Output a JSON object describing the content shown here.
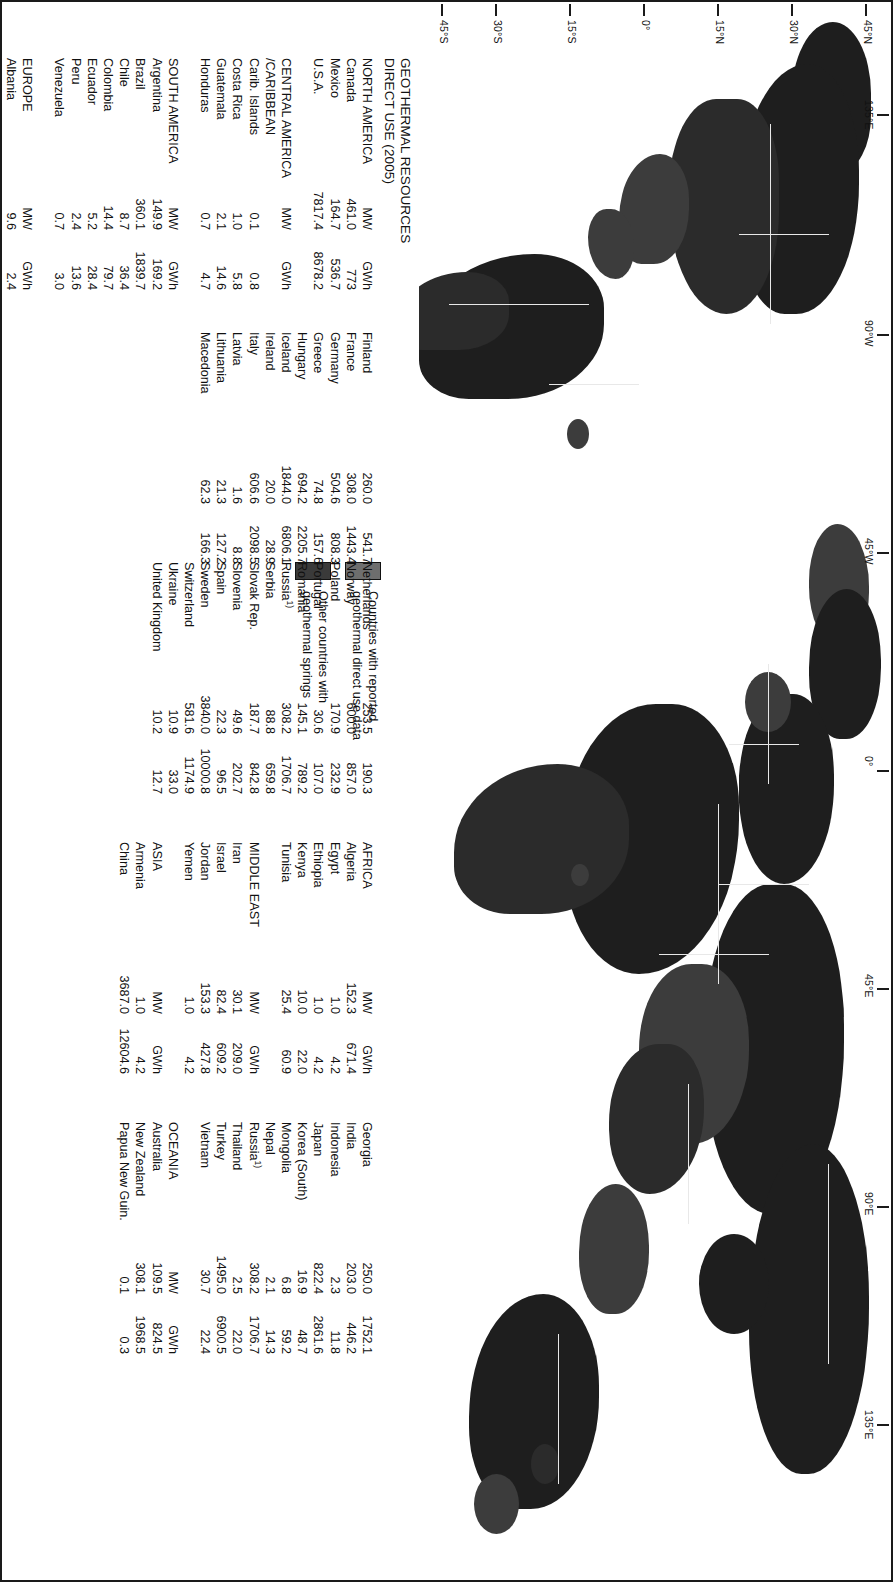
{
  "figure": {
    "title_line1": "GEOTHERMAL RESOURCES",
    "title_line2": "DIRECT USE (2005)",
    "title": "GEOTHERMAL RESOURCES\nDIRECT USE (2005)"
  },
  "legend": {
    "items": [
      {
        "swatch_color": "#6e6e6e",
        "label": "Countries with reported\ngeothermal direct use data"
      },
      {
        "swatch_color": "#3a3a3a",
        "label": "Other countries with\ngeothermal springs"
      }
    ]
  },
  "axis": {
    "latitude_labels": [
      "45°N",
      "45°N",
      "30°N",
      "15°N",
      "0°",
      "15°S",
      "30°S",
      "45°S"
    ],
    "longitude_labels": [
      "135°E",
      "90°W",
      "45°W",
      "0°",
      "45°E",
      "90°E",
      "135°E"
    ]
  },
  "units": {
    "mw": "MW",
    "gwh": "GWh"
  },
  "columns": [
    {
      "id": "col1",
      "blocks": [
        {
          "region": "NORTH AMERICA",
          "unit_mw": "MW",
          "unit_gwh": "GWh",
          "rows": [
            {
              "country": "Canada",
              "mw": "461.0",
              "gwh": "773"
            },
            {
              "country": "Mexico",
              "mw": "164.7",
              "gwh": "536.7"
            },
            {
              "country": "U.S.A.",
              "mw": "7817.4",
              "gwh": "8678.2"
            }
          ]
        },
        {
          "region": "CENTRAL AMERICA",
          "region_line2": "/CARIBBEAN",
          "unit_mw": "MW",
          "unit_gwh": "GWh",
          "rows": [
            {
              "country": "Carib. Islands",
              "mw": "0.1",
              "gwh": "0.8"
            },
            {
              "country": "Costa Rica",
              "mw": "1.0",
              "gwh": "5.8"
            },
            {
              "country": "Guatemala",
              "mw": "2.1",
              "gwh": "14.6"
            },
            {
              "country": "Honduras",
              "mw": "0.7",
              "gwh": "4.7"
            }
          ]
        },
        {
          "region": "SOUTH AMERICA",
          "unit_mw": "MW",
          "unit_gwh": "GWh",
          "rows": [
            {
              "country": "Argentina",
              "mw": "149.9",
              "gwh": "169.2"
            },
            {
              "country": "Brazil",
              "mw": "360.1",
              "gwh": "1839.7"
            },
            {
              "country": "Chile",
              "mw": "8.7",
              "gwh": "36.4"
            },
            {
              "country": "Colombia",
              "mw": "14.4",
              "gwh": "79.7"
            },
            {
              "country": "Ecuador",
              "mw": "5.2",
              "gwh": "28.4"
            },
            {
              "country": "Peru",
              "mw": "2.4",
              "gwh": "13.6"
            },
            {
              "country": "Venezuela",
              "mw": "0.7",
              "gwh": "3.0"
            }
          ]
        },
        {
          "region": "EUROPE",
          "unit_mw": "MW",
          "unit_gwh": "GWh",
          "rows": [
            {
              "country": "Albania",
              "mw": "9.6",
              "gwh": "2.4"
            },
            {
              "country": "Austria",
              "mw": "352.0",
              "gwh": "619.5"
            },
            {
              "country": "Belarus",
              "mw": "2.0",
              "gwh": "3.7"
            },
            {
              "country": "Belgium",
              "mw": "63.9",
              "gwh": "119.8"
            },
            {
              "country": "Bulgaria",
              "mw": "109.6",
              "gwh": "464.3"
            },
            {
              "country": "Croatia",
              "mw": "114.0",
              "gwh": "189.4"
            },
            {
              "country": "Czech Rep.",
              "mw": "204.5",
              "gwh": "338.9"
            },
            {
              "country": "Denmark",
              "mw": "330.0",
              "gwh": "1222.3"
            }
          ]
        }
      ]
    },
    {
      "id": "col2",
      "blocks": [
        {
          "region": "",
          "unit_mw": "",
          "unit_gwh": "",
          "rows": [
            {
              "country": "Finland",
              "mw": "260.0",
              "gwh": "541.7"
            },
            {
              "country": "France",
              "mw": "308.0",
              "gwh": "1443.4"
            },
            {
              "country": "Germany",
              "mw": "504.6",
              "gwh": "808.3"
            },
            {
              "country": "Greece",
              "mw": "74.8",
              "gwh": "157.6"
            },
            {
              "country": "Hungary",
              "mw": "694.2",
              "gwh": "2205.7"
            },
            {
              "country": "Iceland",
              "mw": "1844.0",
              "gwh": "6806.1"
            },
            {
              "country": "Ireland",
              "mw": "20.0",
              "gwh": "28.9"
            },
            {
              "country": "Italy",
              "mw": "606.6",
              "gwh": "2098.5"
            },
            {
              "country": "Latvia",
              "mw": "1.6",
              "gwh": "8.8"
            },
            {
              "country": "Lithuania",
              "mw": "21.3",
              "gwh": "127.2"
            },
            {
              "country": "Macedonia",
              "mw": "62.3",
              "gwh": "166.3"
            }
          ]
        }
      ]
    },
    {
      "id": "col3",
      "blocks": [
        {
          "region": "",
          "unit_mw": "",
          "unit_gwh": "",
          "rows": [
            {
              "country": "Netherlands",
              "mw": "253.5",
              "gwh": "190.3"
            },
            {
              "country": "Norway",
              "mw": "600.0",
              "gwh": "857.0"
            },
            {
              "country": "Poland",
              "mw": "170.9",
              "gwh": "232.9"
            },
            {
              "country": "Portugal",
              "mw": "30.6",
              "gwh": "107.0"
            },
            {
              "country": "Romania",
              "mw": "145.1",
              "gwh": "789.2"
            },
            {
              "country": "Russia",
              "footnote": "1)",
              "mw": "308.2",
              "gwh": "1706.7"
            },
            {
              "country": "Serbia",
              "mw": "88.8",
              "gwh": "659.8"
            },
            {
              "country": "Slovak Rep.",
              "mw": "187.7",
              "gwh": "842.8"
            },
            {
              "country": "Slovenia",
              "mw": "49.6",
              "gwh": "202.7"
            },
            {
              "country": "Spain",
              "mw": "22.3",
              "gwh": "96.5"
            },
            {
              "country": "Sweden",
              "mw": "3840.0",
              "gwh": "10000.8"
            },
            {
              "country": "Switzerland",
              "mw": "581.6",
              "gwh": "1174.9"
            },
            {
              "country": "Ukraine",
              "mw": "10.9",
              "gwh": "33.0"
            },
            {
              "country": "United Kingdom",
              "mw": "10.2",
              "gwh": "12.7"
            }
          ]
        }
      ]
    },
    {
      "id": "col4",
      "blocks": [
        {
          "region": "AFRICA",
          "unit_mw": "MW",
          "unit_gwh": "GWh",
          "rows": [
            {
              "country": "Algeria",
              "mw": "152.3",
              "gwh": "671.4"
            },
            {
              "country": "Egypt",
              "mw": "1.0",
              "gwh": "4.2"
            },
            {
              "country": "Ethiopia",
              "mw": "1.0",
              "gwh": "4.2"
            },
            {
              "country": "Kenya",
              "mw": "10.0",
              "gwh": "22.0"
            },
            {
              "country": "Tunisia",
              "mw": "25.4",
              "gwh": "60.9"
            }
          ]
        },
        {
          "region": "MIDDLE EAST",
          "unit_mw": "MW",
          "unit_gwh": "GWh",
          "rows": [
            {
              "country": "Iran",
              "mw": "30.1",
              "gwh": "209.0"
            },
            {
              "country": "Israel",
              "mw": "82.4",
              "gwh": "609.2"
            },
            {
              "country": "Jordan",
              "mw": "153.3",
              "gwh": "427.8"
            },
            {
              "country": "Yemen",
              "mw": "1.0",
              "gwh": "4.2"
            }
          ]
        },
        {
          "region": "ASIA",
          "unit_mw": "MW",
          "unit_gwh": "GWh",
          "rows": [
            {
              "country": "Armenia",
              "mw": "1.0",
              "gwh": "4.2"
            },
            {
              "country": "China",
              "mw": "3687.0",
              "gwh": "12604.6"
            }
          ]
        }
      ]
    },
    {
      "id": "col5",
      "blocks": [
        {
          "region": "",
          "unit_mw": "",
          "unit_gwh": "",
          "rows": [
            {
              "country": "Georgia",
              "mw": "250.0",
              "gwh": "1752.1"
            },
            {
              "country": "India",
              "mw": "203.0",
              "gwh": "446.2"
            },
            {
              "country": "Indonesia",
              "mw": "2.3",
              "gwh": "11.8"
            },
            {
              "country": "Japan",
              "mw": "822.4",
              "gwh": "2861.6"
            },
            {
              "country": "Korea (South)",
              "mw": "16.9",
              "gwh": "48.7"
            },
            {
              "country": "Mongolia",
              "mw": "6.8",
              "gwh": "59.2"
            },
            {
              "country": "Nepal",
              "mw": "2.1",
              "gwh": "14.3"
            },
            {
              "country": "Russia",
              "footnote": "1)",
              "mw": "308.2",
              "gwh": "1706.7"
            },
            {
              "country": "Thailand",
              "mw": "2.5",
              "gwh": "22.0"
            },
            {
              "country": "Turkey",
              "mw": "1495.0",
              "gwh": "6900.5"
            },
            {
              "country": "Vietnam",
              "mw": "30.7",
              "gwh": "22.4"
            }
          ]
        },
        {
          "region": "OCEANIA",
          "unit_mw": "MW",
          "unit_gwh": "GWh",
          "rows": [
            {
              "country": "Australia",
              "mw": "109.5",
              "gwh": "824.5"
            },
            {
              "country": "New Zealand",
              "mw": "308.1",
              "gwh": "1968.5"
            },
            {
              "country": "Papua New Guin.",
              "mw": "0.1",
              "gwh": "0.3"
            }
          ]
        }
      ]
    }
  ]
}
